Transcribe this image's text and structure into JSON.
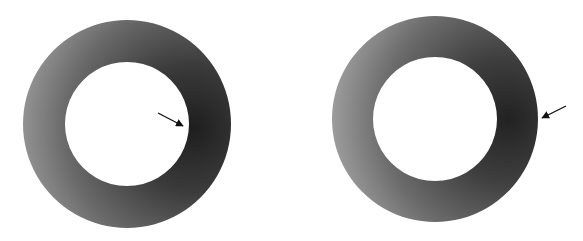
{
  "figure": {
    "panels": [
      {
        "id": "left",
        "description": "annular ring with shading gradient, arrow pointing at inner edge",
        "arrow_target": "inner-edge"
      },
      {
        "id": "right",
        "description": "annular ring with shading gradient, arrow pointing at outer edge",
        "arrow_target": "outer-edge"
      }
    ],
    "colors": {
      "light": "#9a9a9a",
      "mid": "#6e6e6e",
      "dark": "#262626",
      "background": "#ffffff",
      "arrow": "#111111"
    }
  }
}
